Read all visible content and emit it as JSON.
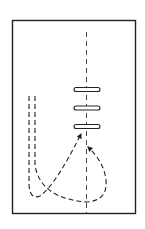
{
  "diagram": {
    "type": "lacing-threading-diagram",
    "frame": {
      "x": 12,
      "y": 20,
      "width": 123,
      "height": 194
    },
    "center_line": {
      "x": 86,
      "y1": 32,
      "y2": 214
    },
    "slots": [
      {
        "x": 74,
        "y": 89,
        "width": 26,
        "height": 4
      },
      {
        "x": 74,
        "y": 107,
        "width": 26,
        "height": 4
      },
      {
        "x": 74,
        "y": 126,
        "width": 26,
        "height": 4
      }
    ],
    "strands": [
      {
        "name": "strand-left",
        "path": "M29 96 L29 185 Q30 200 40 196 Q55 185 80 136",
        "arrow_at": [
          82,
          132
        ]
      },
      {
        "name": "strand-right",
        "path": "M35 96 L35 165 Q40 195 86 202 Q108 200 106 180 Q104 162 88 150",
        "arrow_at": [
          87,
          146
        ]
      }
    ],
    "colors": {
      "stroke": "#222222",
      "background": "#ffffff"
    }
  }
}
